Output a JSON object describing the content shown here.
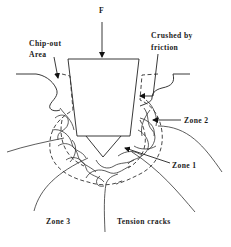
{
  "diagram": {
    "labels": {
      "force": "F",
      "chip_out_line1": "Chip-out",
      "chip_out_line2": "Area",
      "crushed_line1": "Crushed by",
      "crushed_line2": "friction",
      "zone1": "Zone 1",
      "zone2": "Zone 2",
      "zone3": "Zone 3",
      "tension_cracks": "Tension cracks"
    },
    "colors": {
      "line": "#222222",
      "text": "#1a1a1a",
      "background": "#ffffff"
    }
  }
}
